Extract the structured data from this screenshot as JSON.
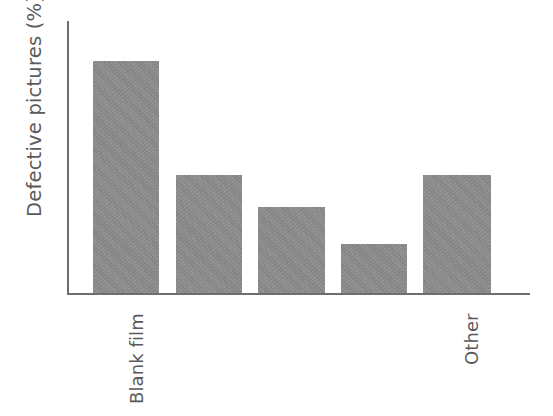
{
  "chart_data": {
    "type": "bar",
    "title": "",
    "subtitle": "",
    "xlabel": "",
    "ylabel": "Defective pictures (%)",
    "categories": [
      "Blank film",
      "",
      "",
      "",
      "Other"
    ],
    "visible_tick_labels": [
      "Blank film",
      "Other"
    ],
    "values": [
      100,
      51,
      37,
      21,
      51
    ],
    "ylim": [
      0,
      118
    ],
    "grid": false,
    "legend": null,
    "annotations": [],
    "bar_color": "#8d8d8d",
    "axis_color": "#6e6e6e",
    "text_color": "#5a5a5a",
    "background_color": "#ffffff"
  },
  "axis": {
    "y_title": "Defective pictures (%)"
  },
  "ticks": {
    "first": "Blank film",
    "last": "Other"
  }
}
